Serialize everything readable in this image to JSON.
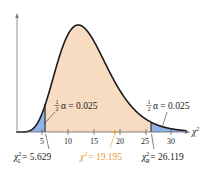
{
  "chart_data": {
    "type": "area",
    "title": "",
    "distribution": "chi-square",
    "degrees_of_freedom": 14,
    "xlabel": "χ²",
    "ylabel": "",
    "x_ticks": [
      5,
      10,
      15,
      20,
      25,
      30
    ],
    "xlim": [
      0,
      33
    ],
    "grid": false,
    "legend": null,
    "regions": [
      {
        "name": "left-tail",
        "from": 0,
        "to": 5.629,
        "color": "#8fb2e8",
        "area_label": "½α = 0.025"
      },
      {
        "name": "acceptance-region",
        "from": 5.629,
        "to": 26.119,
        "color": "#f8dcc2"
      },
      {
        "name": "right-tail",
        "from": 26.119,
        "to": 33,
        "color": "#8fb2e8",
        "area_label": "½α = 0.025"
      }
    ],
    "critical_values": [
      {
        "name": "left",
        "symbol": "χ²_L",
        "value": 5.629
      },
      {
        "name": "right",
        "symbol": "χ²_R",
        "value": 26.119
      }
    ],
    "test_statistic": {
      "symbol": "χ²",
      "value": 19.195,
      "color": "#e79a3a"
    },
    "curve_color": "#1a1a1a"
  },
  "labels": {
    "tick_5": "5",
    "tick_10": "10",
    "tick_15": "15",
    "tick_20": "20",
    "tick_25": "25",
    "tick_30": "30",
    "x_axis_symbol": "χ",
    "x_axis_sup": "2",
    "half": "1",
    "half_den": "2",
    "alpha_left": "α = 0.025",
    "alpha_right": "α = 0.025",
    "chi_left_symbol": "χ",
    "chi_left_sup": "2",
    "chi_left_sub": "L",
    "chi_left_value": "= 5.629",
    "chi_stat_symbol": "χ",
    "chi_stat_sup": "2",
    "chi_stat_value": "= 19.195",
    "chi_right_symbol": "χ",
    "chi_right_sup": "2",
    "chi_right_sub": "R",
    "chi_right_value": "= 26.119"
  }
}
